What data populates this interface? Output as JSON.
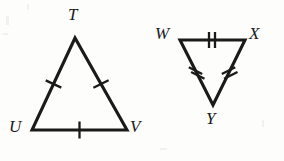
{
  "figure": {
    "background_color": "#fdfdfb",
    "stroke_color": "#1a1a1a",
    "triangles": [
      {
        "name": "TUV",
        "orientation": "apex-up",
        "vertices": [
          {
            "label": "T",
            "x": 75,
            "y": 38,
            "label_x": 68,
            "label_y": 6
          },
          {
            "label": "U",
            "x": 32,
            "y": 130,
            "label_x": 9,
            "label_y": 118
          },
          {
            "label": "V",
            "x": 127,
            "y": 130,
            "label_x": 130,
            "label_y": 118
          }
        ],
        "sides": [
          {
            "name": "TU",
            "ticks": 1,
            "tick_orientation": "perpendicular"
          },
          {
            "name": "TV",
            "ticks": 1,
            "tick_orientation": "perpendicular"
          },
          {
            "name": "UV",
            "ticks": 1,
            "tick_orientation": "perpendicular"
          }
        ]
      },
      {
        "name": "WXY",
        "orientation": "apex-down",
        "vertices": [
          {
            "label": "W",
            "x": 180,
            "y": 40,
            "label_x": 155,
            "label_y": 25
          },
          {
            "label": "X",
            "x": 245,
            "y": 40,
            "label_x": 249,
            "label_y": 25
          },
          {
            "label": "Y",
            "x": 213,
            "y": 105,
            "label_x": 206,
            "label_y": 110
          }
        ],
        "sides": [
          {
            "name": "WX",
            "ticks": 2,
            "tick_orientation": "perpendicular"
          },
          {
            "name": "WY",
            "ticks": 2,
            "tick_orientation": "perpendicular"
          },
          {
            "name": "XY",
            "ticks": 2,
            "tick_orientation": "perpendicular"
          }
        ]
      }
    ]
  }
}
